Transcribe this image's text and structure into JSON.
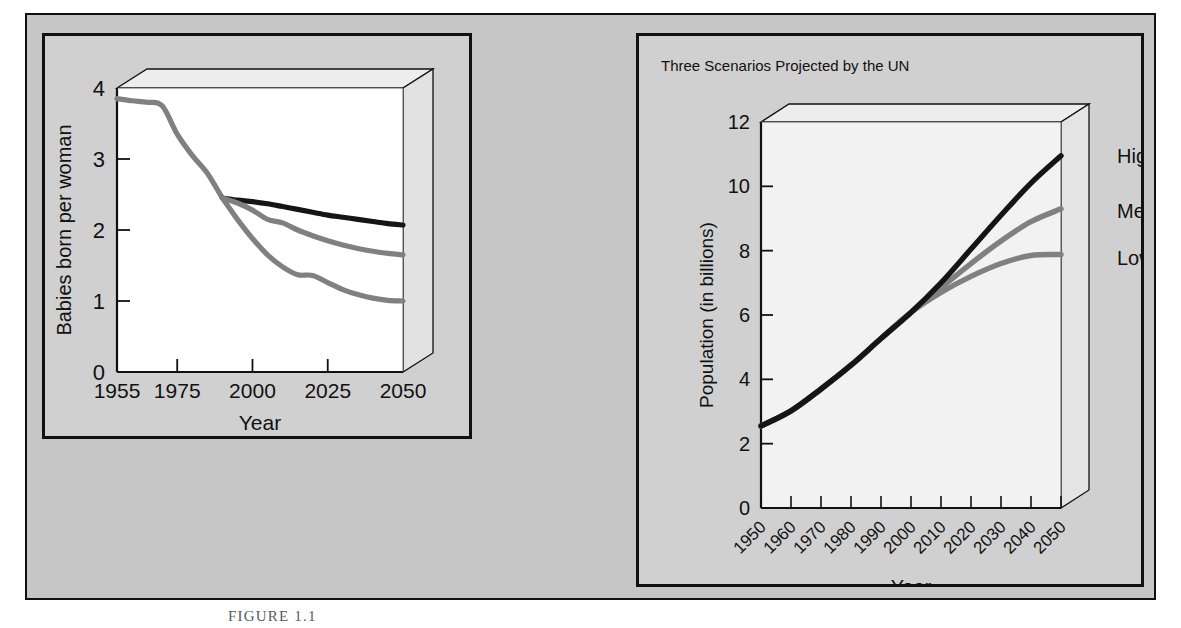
{
  "figure": {
    "caption": "FIGURE 1.1",
    "background_color": "#c6c6c6",
    "frame_color": "#111111"
  },
  "colors": {
    "black_line": "#151515",
    "gray_line": "#808080",
    "panel_bg": "#d0d0d0",
    "plot_bg_left": "#ffffff",
    "plot_bg_right": "#f2f2f2"
  },
  "left_panel": {
    "title": ""
  },
  "right_panel": {
    "title": "Three Scenarios Projected by the UN"
  },
  "chart_data": [
    {
      "id": "fertility",
      "type": "line",
      "title": "",
      "xlabel": "Year",
      "ylabel": "Babies born per woman",
      "xlim": [
        1955,
        2050
      ],
      "ylim": [
        0,
        4
      ],
      "xticks": [
        1955,
        1975,
        2000,
        2025,
        2050
      ],
      "yticks": [
        0,
        1,
        2,
        3,
        4
      ],
      "grid": false,
      "legend": "none",
      "series": [
        {
          "name": "Historical",
          "color": "#808080",
          "x": [
            1955,
            1960,
            1965,
            1970,
            1975,
            1980,
            1985,
            1990
          ],
          "values": [
            3.85,
            3.82,
            3.8,
            3.75,
            3.35,
            3.05,
            2.8,
            2.45
          ]
        },
        {
          "name": "High",
          "color": "#151515",
          "x": [
            1990,
            1995,
            2000,
            2005,
            2010,
            2015,
            2020,
            2025,
            2030,
            2035,
            2040,
            2045,
            2050
          ],
          "values": [
            2.45,
            2.42,
            2.4,
            2.37,
            2.33,
            2.29,
            2.25,
            2.21,
            2.18,
            2.15,
            2.12,
            2.09,
            2.07
          ]
        },
        {
          "name": "Medium",
          "color": "#808080",
          "x": [
            1990,
            1995,
            2000,
            2005,
            2010,
            2015,
            2020,
            2025,
            2030,
            2035,
            2040,
            2045,
            2050
          ],
          "values": [
            2.45,
            2.38,
            2.28,
            2.15,
            2.1,
            2.0,
            1.92,
            1.85,
            1.79,
            1.74,
            1.7,
            1.67,
            1.65
          ]
        },
        {
          "name": "Low",
          "color": "#808080",
          "x": [
            1990,
            1995,
            2000,
            2005,
            2010,
            2015,
            2020,
            2025,
            2030,
            2035,
            2040,
            2045,
            2050
          ],
          "values": [
            2.45,
            2.15,
            1.88,
            1.65,
            1.48,
            1.37,
            1.36,
            1.26,
            1.16,
            1.09,
            1.04,
            1.01,
            1.0
          ]
        }
      ]
    },
    {
      "id": "population",
      "type": "line",
      "title": "Three Scenarios Projected by the UN",
      "xlabel": "Year",
      "ylabel": "Population (in billions)",
      "xlim": [
        1950,
        2050
      ],
      "ylim": [
        0,
        12
      ],
      "xticks": [
        1950,
        1960,
        1970,
        1980,
        1990,
        2000,
        2010,
        2020,
        2030,
        2040,
        2050
      ],
      "yticks": [
        0,
        2,
        4,
        6,
        8,
        10,
        12
      ],
      "grid": false,
      "legend": "right-of-axis",
      "annotations": [
        "High",
        "Medium",
        "Low"
      ],
      "series": [
        {
          "name": "High",
          "label": "High",
          "color": "#151515",
          "x": [
            1950,
            1960,
            1970,
            1980,
            1990,
            2000,
            2010,
            2020,
            2030,
            2040,
            2050
          ],
          "values": [
            2.55,
            3.02,
            3.7,
            4.44,
            5.27,
            6.08,
            7.0,
            8.05,
            9.1,
            10.1,
            10.95
          ]
        },
        {
          "name": "Medium",
          "label": "Medium",
          "color": "#808080",
          "x": [
            1950,
            1960,
            1970,
            1980,
            1990,
            2000,
            2010,
            2020,
            2030,
            2040,
            2050
          ],
          "values": [
            2.55,
            3.02,
            3.7,
            4.44,
            5.27,
            6.08,
            6.85,
            7.6,
            8.3,
            8.9,
            9.3
          ]
        },
        {
          "name": "Low",
          "label": "Low",
          "color": "#808080",
          "x": [
            1950,
            1960,
            1970,
            1980,
            1990,
            2000,
            2010,
            2020,
            2030,
            2040,
            2050
          ],
          "values": [
            2.55,
            3.02,
            3.7,
            4.44,
            5.27,
            6.08,
            6.7,
            7.2,
            7.6,
            7.85,
            7.88
          ]
        }
      ]
    }
  ]
}
